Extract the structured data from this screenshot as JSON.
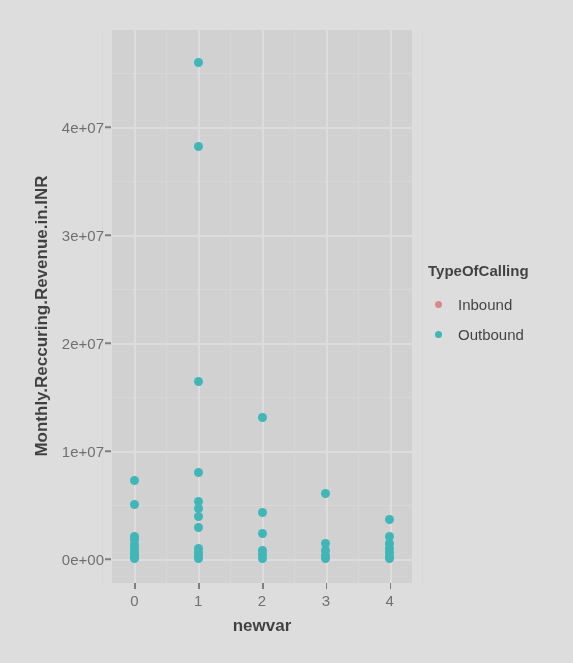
{
  "chart_data": {
    "type": "scatter",
    "title": "",
    "xlabel": "newvar",
    "ylabel": "Monthly.Reccuring.Revenue.in.INR",
    "xlim": [
      -0.35,
      4.35
    ],
    "ylim": [
      -2200000,
      49000000
    ],
    "grid": true,
    "legend_position": "right",
    "legend": {
      "title": "TypeOfCalling",
      "entries": [
        {
          "name": "Inbound",
          "color": "#f8766d"
        },
        {
          "name": "Outbound",
          "color": "#00bfc4"
        }
      ]
    },
    "x_ticks": [
      {
        "value": 0,
        "label": "0"
      },
      {
        "value": 1,
        "label": "1"
      },
      {
        "value": 2,
        "label": "2"
      },
      {
        "value": 3,
        "label": "3"
      },
      {
        "value": 4,
        "label": "4"
      }
    ],
    "y_ticks": [
      {
        "value": 0,
        "label": "0e+00"
      },
      {
        "value": 10000000,
        "label": "1e+07"
      },
      {
        "value": 20000000,
        "label": "2e+07"
      },
      {
        "value": 30000000,
        "label": "3e+07"
      },
      {
        "value": 40000000,
        "label": "4e+07"
      }
    ],
    "y_minor_ticks": [
      5000000,
      15000000,
      25000000,
      35000000,
      45000000
    ],
    "x_minor_ticks": [
      -0.5,
      0.5,
      1.5,
      2.5,
      3.5,
      4.5
    ],
    "series": [
      {
        "name": "Outbound",
        "color": "#00bfc4",
        "points": [
          {
            "x": 0,
            "y": 7300000
          },
          {
            "x": 0,
            "y": 5100000
          },
          {
            "x": 0,
            "y": 2100000
          },
          {
            "x": 0,
            "y": 1800000
          },
          {
            "x": 0,
            "y": 1400000
          },
          {
            "x": 0,
            "y": 1000000
          },
          {
            "x": 0,
            "y": 700000
          },
          {
            "x": 0,
            "y": 400000
          },
          {
            "x": 0,
            "y": 150000
          },
          {
            "x": 0,
            "y": 60000
          },
          {
            "x": 1,
            "y": 46000000
          },
          {
            "x": 1,
            "y": 38200000
          },
          {
            "x": 1,
            "y": 16500000
          },
          {
            "x": 1,
            "y": 8000000
          },
          {
            "x": 1,
            "y": 5300000
          },
          {
            "x": 1,
            "y": 4700000
          },
          {
            "x": 1,
            "y": 4000000
          },
          {
            "x": 1,
            "y": 2900000
          },
          {
            "x": 1,
            "y": 1000000
          },
          {
            "x": 1,
            "y": 600000
          },
          {
            "x": 1,
            "y": 300000
          },
          {
            "x": 1,
            "y": 80000
          },
          {
            "x": 2,
            "y": 13100000
          },
          {
            "x": 2,
            "y": 4300000
          },
          {
            "x": 2,
            "y": 2400000
          },
          {
            "x": 2,
            "y": 800000
          },
          {
            "x": 2,
            "y": 400000
          },
          {
            "x": 2,
            "y": 100000
          },
          {
            "x": 3,
            "y": 6100000
          },
          {
            "x": 3,
            "y": 1500000
          },
          {
            "x": 3,
            "y": 800000
          },
          {
            "x": 3,
            "y": 300000
          },
          {
            "x": 3,
            "y": 80000
          },
          {
            "x": 4,
            "y": 3700000
          },
          {
            "x": 4,
            "y": 2100000
          },
          {
            "x": 4,
            "y": 1500000
          },
          {
            "x": 4,
            "y": 1000000
          },
          {
            "x": 4,
            "y": 600000
          },
          {
            "x": 4,
            "y": 250000
          },
          {
            "x": 4,
            "y": 60000
          }
        ]
      },
      {
        "name": "Inbound",
        "color": "#f8766d",
        "points": []
      }
    ]
  }
}
